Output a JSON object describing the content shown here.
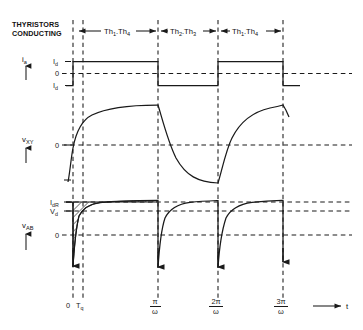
{
  "figure": {
    "title_lines": [
      "THYRISTORS",
      "CONDUCTING"
    ],
    "conduction_intervals": [
      {
        "label_main1": "Th",
        "sub1": "1",
        "sep": ".",
        "label_main2": "Th",
        "sub2": "4",
        "text": "Th1.Th4"
      },
      {
        "label_main1": "Th",
        "sub1": "2",
        "sep": ".",
        "label_main2": "Th",
        "sub2": "3",
        "text": "Th2.Th3"
      },
      {
        "label_main1": "Th",
        "sub1": "1",
        "sep": ".",
        "label_main2": "Th",
        "sub2": "4",
        "text": "Th1.Th4"
      }
    ]
  },
  "axes": {
    "time_axis_label": "t",
    "x_ticks": [
      {
        "label": "0",
        "type": "plain"
      },
      {
        "label": "T",
        "sub": "q",
        "type": "sub"
      },
      {
        "num": "π",
        "den": "ω",
        "type": "fraction"
      },
      {
        "num": "2π",
        "den": "ω",
        "type": "fraction"
      },
      {
        "num": "3π",
        "den": "ω",
        "type": "fraction"
      }
    ]
  },
  "signals": [
    {
      "name": "ia",
      "label_main": "i",
      "label_sub": "a",
      "level_labels": [
        {
          "main": "I",
          "sub": "d"
        },
        {
          "main": "0",
          "sub": ""
        },
        {
          "main": "I",
          "sub": "d"
        }
      ],
      "waveform_type": "square",
      "description": "alternating square wave between +Id and -Id"
    },
    {
      "name": "vXY",
      "label_main": "v",
      "label_sub": "XY",
      "level_labels": [
        {
          "main": "0",
          "sub": ""
        }
      ],
      "waveform_type": "exponential-alternating",
      "description": "exponential rise and fall about zero"
    },
    {
      "name": "vAB",
      "label_main": "v",
      "label_sub": "AB",
      "level_labels": [
        {
          "main": "I",
          "sub": "dR"
        },
        {
          "main": "V",
          "sub": "d"
        },
        {
          "main": "0",
          "sub": ""
        }
      ],
      "waveform_type": "exponential-recovery",
      "description": "repeated exponential recovery with hatched area in first interval"
    }
  ],
  "colors": {
    "ink": "#1a1a1a",
    "background": "#ffffff"
  }
}
